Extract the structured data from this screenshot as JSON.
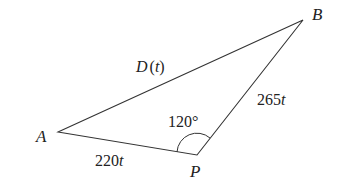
{
  "diagram": {
    "type": "triangle",
    "vertices": {
      "A": {
        "label": "A"
      },
      "B": {
        "label": "B"
      },
      "P": {
        "label": "P"
      }
    },
    "sides": {
      "AB": {
        "label": "D(t)",
        "fn": "D",
        "arg": "t"
      },
      "AP": {
        "label": "220t",
        "coef": "220",
        "var": "t"
      },
      "PB": {
        "label": "265t",
        "coef": "265",
        "var": "t"
      }
    },
    "angle_P": {
      "label": "120°"
    }
  }
}
